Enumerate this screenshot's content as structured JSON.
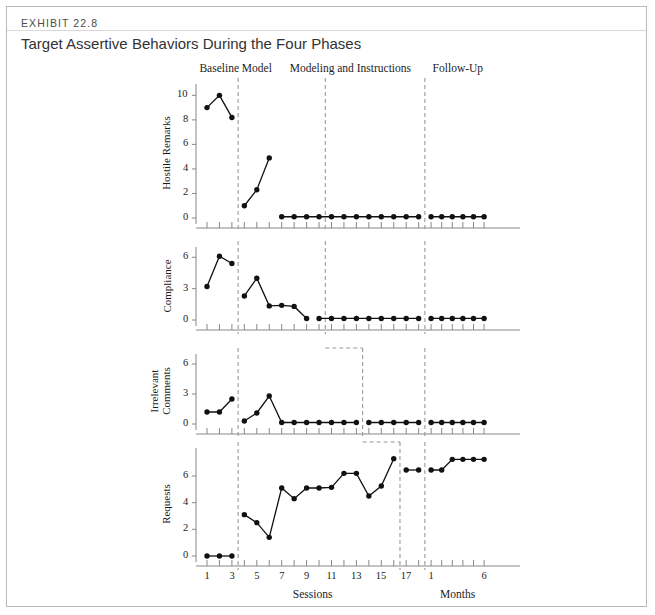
{
  "exhibit": {
    "label": "EXHIBIT 22.8",
    "title": "Target Assertive Behaviors During the Four Phases"
  },
  "colors": {
    "frame_border": "#b9b9b9",
    "rule": "#d8d8d8",
    "axis": "#888888",
    "series": "#111111",
    "phase_divider": "#999999",
    "background": "#ffffff"
  },
  "chart_data": {
    "type": "line",
    "title": "Target Assertive Behaviors During the Four Phases",
    "xlabel_sessions": "Sessions",
    "xlabel_months": "Months",
    "grid": false,
    "legend": "none",
    "phases": [
      {
        "name": "Baseline",
        "label": "Baseline",
        "start_session": 1,
        "end_session": 3
      },
      {
        "name": "Model",
        "label": "Model",
        "start_session": 4,
        "end_session": 6
      },
      {
        "name": "Modeling and Instructions",
        "label": "Modeling and Instructions",
        "start_session": 7,
        "end_session": 18
      },
      {
        "name": "Follow-Up",
        "label": "Follow-Up",
        "start_month": 1,
        "end_month": 6
      }
    ],
    "x_sessions": [
      1,
      2,
      3,
      4,
      5,
      6,
      7,
      8,
      9,
      10,
      11,
      12,
      13,
      14,
      15,
      16,
      17,
      18
    ],
    "x_session_ticklabels": [
      "1",
      "",
      "3",
      "",
      "5",
      "",
      "7",
      "",
      "9",
      "",
      "11",
      "",
      "13",
      "",
      "15",
      "",
      "17",
      ""
    ],
    "x_months": [
      1,
      2,
      3,
      4,
      5,
      6
    ],
    "x_month_ticklabels": [
      "1",
      "",
      "",
      "",
      "",
      "6"
    ],
    "panels": [
      {
        "id": "hostile-remarks",
        "ylabel": "Hostile Remarks",
        "ylim": [
          0,
          10.6
        ],
        "yticks": [
          0,
          2,
          4,
          6,
          8,
          10
        ],
        "yticklabels": [
          "0",
          "2",
          "4",
          "6",
          "8",
          "10"
        ],
        "divider_after_session": 10,
        "segments": [
          {
            "phase": "Baseline",
            "x": [
              1,
              2,
              3
            ],
            "y": [
              9.0,
              10.0,
              8.2
            ]
          },
          {
            "phase": "Model",
            "x": [
              4,
              5,
              6
            ],
            "y": [
              1.0,
              2.3,
              4.9
            ]
          },
          {
            "phase": "Modeling and Instructions",
            "x": [
              7,
              8,
              9,
              10,
              11,
              12,
              13,
              14,
              15,
              16,
              17,
              18
            ],
            "y": [
              0.1,
              0.1,
              0.1,
              0.1,
              0.1,
              0.1,
              0.1,
              0.1,
              0.1,
              0.1,
              0.1,
              0.1
            ]
          },
          {
            "phase": "Follow-Up",
            "months": [
              1,
              2,
              3,
              4,
              5,
              6
            ],
            "y": [
              0.1,
              0.1,
              0.1,
              0.1,
              0.1,
              0.1
            ]
          }
        ]
      },
      {
        "id": "compliance",
        "ylabel": "Compliance",
        "ylim": [
          0,
          6.6
        ],
        "yticks": [
          0,
          3,
          6
        ],
        "yticklabels": [
          "0",
          "3",
          "6"
        ],
        "divider_after_session": 10,
        "segments": [
          {
            "phase": "Baseline",
            "x": [
              1,
              2,
              3
            ],
            "y": [
              3.2,
              6.1,
              5.4
            ]
          },
          {
            "phase": "Model",
            "x": [
              4,
              5,
              6,
              7,
              8,
              9
            ],
            "y": [
              2.3,
              4.0,
              1.35,
              1.4,
              1.3,
              0.15
            ]
          },
          {
            "phase": "Modeling and Instructions",
            "x": [
              10,
              11,
              12,
              13,
              14,
              15,
              16,
              17,
              18
            ],
            "y": [
              0.15,
              0.15,
              0.15,
              0.15,
              0.15,
              0.15,
              0.15,
              0.15,
              0.15
            ]
          },
          {
            "phase": "Follow-Up",
            "months": [
              1,
              2,
              3,
              4,
              5,
              6
            ],
            "y": [
              0.15,
              0.15,
              0.15,
              0.15,
              0.15,
              0.15
            ]
          }
        ]
      },
      {
        "id": "irrelevant-comments",
        "ylabel": "Irrelevant Comments",
        "ylabel_lines": [
          "Irrelevant",
          "Comments"
        ],
        "ylim": [
          0,
          6.6
        ],
        "yticks": [
          0,
          3,
          6
        ],
        "yticklabels": [
          "0",
          "3",
          "6"
        ],
        "divider_after_session": 13,
        "segments": [
          {
            "phase": "Baseline",
            "x": [
              1,
              2,
              3
            ],
            "y": [
              1.2,
              1.2,
              2.5
            ]
          },
          {
            "phase": "Model",
            "x": [
              4,
              5,
              6,
              7,
              8,
              9,
              10,
              11,
              12,
              13
            ],
            "y": [
              0.3,
              1.1,
              2.8,
              0.15,
              0.15,
              0.15,
              0.15,
              0.15,
              0.15,
              0.15
            ]
          },
          {
            "phase": "Modeling and Instructions",
            "x": [
              14,
              15,
              16,
              17,
              18
            ],
            "y": [
              0.15,
              0.15,
              0.15,
              0.15,
              0.15
            ]
          },
          {
            "phase": "Follow-Up",
            "months": [
              1,
              2,
              3,
              4,
              5,
              6
            ],
            "y": [
              0.15,
              0.15,
              0.15,
              0.15,
              0.15,
              0.15
            ]
          }
        ]
      },
      {
        "id": "requests",
        "ylabel": "Requests",
        "ylim": [
          0,
          7.8
        ],
        "yticks": [
          0,
          2,
          4,
          6
        ],
        "yticklabels": [
          "0",
          "2",
          "4",
          "6"
        ],
        "divider_after_session": 16,
        "segments": [
          {
            "phase": "Baseline",
            "x": [
              1,
              2,
              3
            ],
            "y": [
              0.0,
              0.0,
              0.0
            ]
          },
          {
            "phase": "Model + Modeling",
            "x": [
              4,
              5,
              6,
              7,
              8,
              9,
              10,
              11,
              12,
              13,
              14,
              15,
              16
            ],
            "y": [
              3.1,
              2.5,
              1.4,
              5.1,
              4.3,
              5.1,
              5.1,
              5.15,
              6.2,
              6.2,
              4.5,
              5.25,
              7.3
            ]
          },
          {
            "phase": "Modeling and Instructions",
            "x": [
              17,
              18
            ],
            "y": [
              6.45,
              6.45
            ]
          },
          {
            "phase": "Follow-Up",
            "months": [
              1,
              2,
              3,
              4,
              5,
              6
            ],
            "y": [
              6.45,
              6.45,
              7.25,
              7.25,
              7.25,
              7.25
            ]
          }
        ]
      }
    ]
  }
}
